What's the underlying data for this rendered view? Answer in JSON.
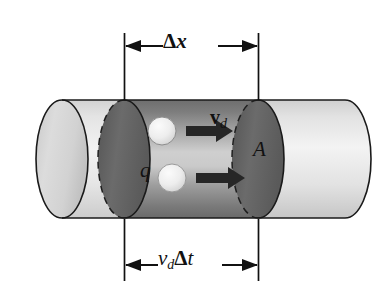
{
  "figure": {
    "type": "physics-diagram",
    "background_color": "#ffffff",
    "labels": {
      "top_dimension": {
        "delta": "Δ",
        "variable": "x",
        "full": "Δx",
        "name": "length-of-segment"
      },
      "bottom_dimension": {
        "v": "v",
        "v_sub": "d",
        "delta": "Δ",
        "t": "t",
        "full": "v_d Δt",
        "name": "distance-travelled-in-time-delta-t"
      },
      "drift_velocity": {
        "symbol": "v",
        "subscript": "d",
        "full": "v_d",
        "name": "drift-velocity-vector"
      },
      "area": {
        "symbol": "A",
        "full": "A",
        "name": "cross-sectional-area"
      },
      "charge": {
        "symbol": "q",
        "full": "q",
        "name": "charge-carrier"
      }
    },
    "colors": {
      "outline": "#1a1a1a",
      "cylinder_light": "#e8e8e8",
      "cylinder_mid": "#d0d0d0",
      "end_cap": "#dcdcdc",
      "dark_disc": "#636363",
      "dark_disc_edge": "#4a4a4a",
      "segment_dark": "#7a7a7a",
      "segment_light": "#c4c4c4",
      "sphere": "#ededed",
      "arrow": "#262626",
      "text": "#111111"
    },
    "geometry": {
      "cylinder_left_x": 36,
      "cylinder_right_x": 345,
      "cylinder_top_y": 100,
      "cylinder_bottom_y": 218,
      "cap_rx": 26,
      "cap_ry": 59,
      "segment_left_x": 124,
      "segment_right_x": 258,
      "top_tick_top_y": 33,
      "top_tick_bottom_y": 100,
      "bottom_tick_top_y": 219,
      "bottom_tick_bottom_y": 281,
      "top_arrow_y": 46,
      "bottom_arrow_y": 265
    },
    "spheres": [
      {
        "name": "upper-charge-carrier",
        "cx": 162,
        "cy": 131,
        "r": 14
      },
      {
        "name": "lower-charge-carrier",
        "cx": 172,
        "cy": 178,
        "r": 14
      }
    ],
    "arrows": [
      {
        "name": "upper-drift-arrow",
        "x1": 186,
        "x2": 231,
        "y": 131
      },
      {
        "name": "lower-drift-arrow",
        "x1": 196,
        "x2": 243,
        "y": 178
      }
    ]
  }
}
